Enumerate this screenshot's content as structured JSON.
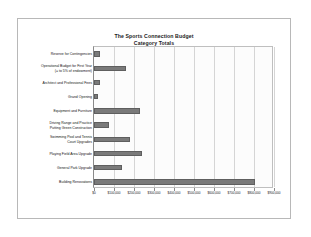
{
  "chart_data": {
    "type": "bar",
    "orientation": "horizontal",
    "title": "The Sports Connection Budget\nCategory Totals",
    "title_line1": "The Sports Connection Budget",
    "title_line2": "Category Totals",
    "xlabel": "",
    "ylabel": "",
    "xlim": [
      0,
      900000
    ],
    "grid": true,
    "legend": false,
    "bar_color": "#7a7a7a",
    "plot_background": "#fcfcfc",
    "gridline_color": "#d5d5d5",
    "tick_labels": [
      "$0",
      "$100,000",
      "$200,000",
      "$300,000",
      "$400,000",
      "$500,000",
      "$600,000",
      "$700,000",
      "$800,000",
      "$900,000"
    ],
    "tick_values": [
      0,
      100000,
      200000,
      300000,
      400000,
      500000,
      600000,
      700000,
      800000,
      900000
    ],
    "categories": [
      "Reserve for Contingencies",
      "Operational Budget for First Year\n(= to 5% of endowment)",
      "Architect and Professional Fees",
      "Grand Opening",
      "Equipment and Furniture",
      "Driving Range and Practice\nPutting Green Construction",
      "Swimming Pool and Tennis\nCourt Upgrades",
      "Playing Field Area Upgrade",
      "General Park Upgrade",
      "Building Renovations"
    ],
    "values": [
      30000,
      160000,
      30000,
      20000,
      230000,
      75000,
      180000,
      240000,
      140000,
      805000
    ]
  }
}
